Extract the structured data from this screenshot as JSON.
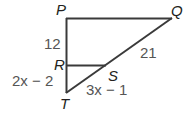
{
  "diagram": {
    "type": "triangle",
    "vertices": {
      "P": {
        "label": "P"
      },
      "Q": {
        "label": "Q"
      },
      "R": {
        "label": "R"
      },
      "S": {
        "label": "S"
      },
      "T": {
        "label": "T"
      }
    },
    "segments": {
      "PR": "12",
      "QS": "21",
      "RT": "2x − 2",
      "ST": "3x − 1"
    }
  }
}
